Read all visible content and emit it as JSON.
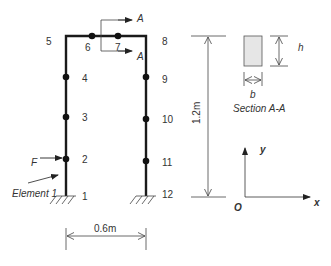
{
  "figure": {
    "frame": {
      "nodes": [
        {
          "id": "1",
          "label": "1"
        },
        {
          "id": "2",
          "label": "2"
        },
        {
          "id": "3",
          "label": "3"
        },
        {
          "id": "4",
          "label": "4"
        },
        {
          "id": "5",
          "label": "5"
        },
        {
          "id": "6",
          "label": "6"
        },
        {
          "id": "7",
          "label": "7"
        },
        {
          "id": "8",
          "label": "8"
        },
        {
          "id": "9",
          "label": "9"
        },
        {
          "id": "10",
          "label": "10"
        },
        {
          "id": "11",
          "label": "11"
        },
        {
          "id": "12",
          "label": "12"
        }
      ],
      "force_label": "F",
      "element_label": "Element 1",
      "section_cut_label_top": "A",
      "section_cut_label_bottom": "A"
    },
    "dimensions": {
      "width": "0.6m",
      "height": "1.2m"
    },
    "section": {
      "title": "Section A-A",
      "width_label": "b",
      "height_label": "h",
      "fill_color": "#e6e6e6"
    },
    "axes": {
      "origin": "O",
      "x_label": "x",
      "y_label": "y"
    },
    "colors": {
      "line": "#1a1a1a",
      "text": "#333333",
      "background": "#ffffff"
    }
  }
}
